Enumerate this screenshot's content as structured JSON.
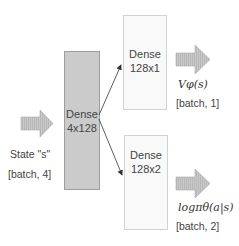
{
  "diagram": {
    "input": {
      "label": "State \"s\"",
      "shape": "[batch, 4]"
    },
    "hidden_layer": {
      "title": "Dense",
      "dims": "4x128",
      "color": "#cbcbcb"
    },
    "value_head": {
      "title": "Dense",
      "dims": "128x1",
      "output_label": "Vφ(s)",
      "output_shape": "[batch, 1]"
    },
    "policy_head": {
      "title": "Dense",
      "dims": "128x2",
      "output_label": "logπθ(a|s)",
      "output_shape": "[batch, 2]"
    },
    "arrow_color": "#c4c4c4",
    "edges": [
      {
        "from": "hidden_layer",
        "to": "value_head"
      },
      {
        "from": "hidden_layer",
        "to": "policy_head"
      }
    ]
  }
}
